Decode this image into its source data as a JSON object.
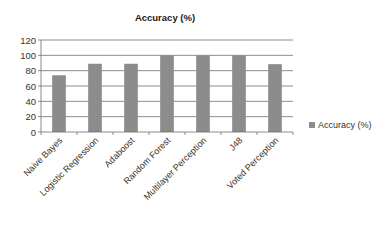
{
  "chart_data": {
    "type": "bar",
    "title": "Accuracy (%)",
    "xlabel": "",
    "ylabel": "",
    "categories": [
      "Naive Bayes",
      "Logistic Regression",
      "Adaboost",
      "Random Forest",
      "Multilayer Perception",
      "J48",
      "Voted Perception"
    ],
    "series": [
      {
        "name": "Accuracy (%)",
        "values": [
          74,
          89,
          89,
          100,
          100,
          100,
          88.5
        ],
        "color": "#8c8c8c"
      }
    ],
    "ylim": [
      0,
      120
    ],
    "yticks": [
      0,
      20,
      40,
      60,
      80,
      100,
      120
    ],
    "grid": true,
    "legend_position": "right"
  }
}
